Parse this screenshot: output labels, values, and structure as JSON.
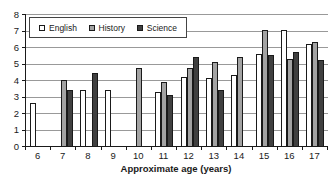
{
  "chart_data": {
    "type": "bar",
    "title": "",
    "xlabel": "Approximate age (years)",
    "ylabel": "",
    "ylim": [
      0,
      8
    ],
    "ytick_step": 1,
    "categories": [
      "6",
      "7",
      "8",
      "9",
      "10",
      "11",
      "12",
      "13",
      "14",
      "15",
      "16",
      "17"
    ],
    "series": [
      {
        "name": "English",
        "color": "#ffffff",
        "values": [
          2.6,
          null,
          3.4,
          3.4,
          null,
          3.3,
          4.2,
          4.1,
          4.3,
          5.6,
          7,
          6.2
        ]
      },
      {
        "name": "History",
        "color": "#a3a3a3",
        "values": [
          null,
          4,
          null,
          null,
          4.7,
          3.9,
          4.7,
          5.1,
          5.4,
          7,
          5.3,
          6.3
        ]
      },
      {
        "name": "Science",
        "color": "#404040",
        "values": [
          null,
          3.4,
          4.4,
          null,
          null,
          3.1,
          5.4,
          3.4,
          null,
          5.5,
          5.7,
          5.2
        ]
      }
    ],
    "bar_border_color": "#1a1a1a",
    "grid": true,
    "gridline_color": "#999999",
    "legend_position": "top-left"
  }
}
